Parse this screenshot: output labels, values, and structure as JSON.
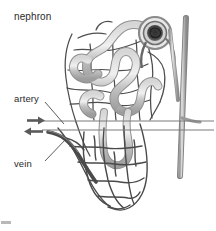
{
  "figure": {
    "title": "nephron",
    "background_color": "#ffffff",
    "width": 216,
    "height": 231
  },
  "labels": {
    "nephron": "nephron",
    "artery": "artery",
    "vein": "vein"
  },
  "colors": {
    "tubule": "#b9b9b9",
    "tubule_shade": "#9a9a9a",
    "capillary": "#4a4a4a",
    "vessel": "#555555",
    "collecting_duct": "#8d8d8d",
    "glomerulus": "#3a3a3a",
    "label_text": "#2b2b2b",
    "leader_line": "#4a4a4a",
    "corner_mark": "#b8b8b8"
  },
  "icons": {
    "artery_arrow": "arrow-right-icon",
    "vein_arrow": "arrow-left-icon"
  },
  "structures": {
    "glomerulus": "glomerulus",
    "bowmans_capsule": "bowmans-capsule",
    "proximal_tubule": "convoluted-tubule",
    "loop_of_henle": "loop-of-henle",
    "collecting_duct": "collecting-duct",
    "peritubular_capillaries": "peritubular-capillary-network",
    "vasa_recta": "vasa-recta",
    "renal_artery": "renal-artery",
    "renal_vein": "renal-vein"
  },
  "flow": {
    "artery_direction": "right",
    "vein_direction": "left"
  }
}
